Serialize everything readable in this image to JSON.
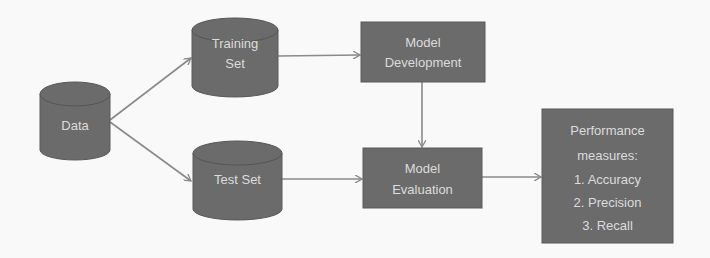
{
  "diagram": {
    "colors": {
      "background": "#f9f9f9",
      "node_fill": "#6b6b6b",
      "node_stroke": "#5a5a5a",
      "node_top": "#777777",
      "text": "#dcdcdc",
      "arrow": "#8a8a8a"
    },
    "nodes": {
      "data": {
        "shape": "cylinder",
        "lines": [
          "Data"
        ]
      },
      "training": {
        "shape": "cylinder",
        "lines": [
          "Training",
          "Set"
        ]
      },
      "test": {
        "shape": "cylinder",
        "lines": [
          "Test Set"
        ]
      },
      "development": {
        "shape": "rectangle",
        "lines": [
          "Model",
          "Development"
        ]
      },
      "evaluation": {
        "shape": "rectangle",
        "lines": [
          "Model",
          "Evaluation"
        ]
      },
      "performance": {
        "shape": "rectangle",
        "lines": [
          "Performance",
          "measures:",
          "1. Accuracy",
          "2. Precision",
          "3. Recall"
        ]
      }
    },
    "edges": [
      {
        "from": "Data",
        "to": "Training Set"
      },
      {
        "from": "Data",
        "to": "Test Set"
      },
      {
        "from": "Training Set",
        "to": "Model Development"
      },
      {
        "from": "Model Development",
        "to": "Model Evaluation"
      },
      {
        "from": "Test Set",
        "to": "Model Evaluation"
      },
      {
        "from": "Model Evaluation",
        "to": "Performance measures"
      }
    ]
  }
}
